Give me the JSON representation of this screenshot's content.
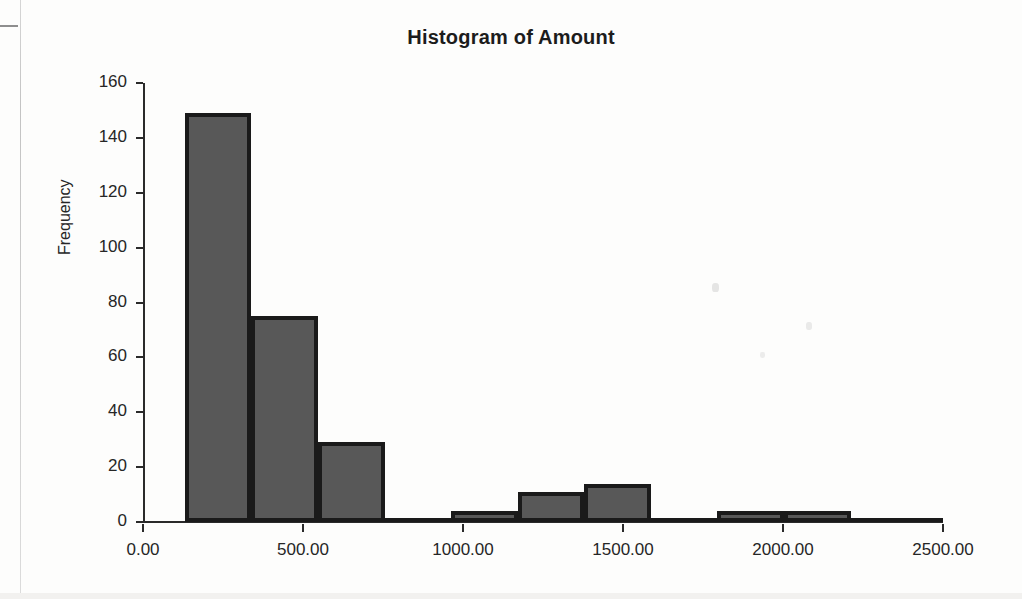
{
  "chart_data": {
    "type": "bar",
    "title": "Histogram of Amount",
    "xlabel": "",
    "ylabel": "Frequency",
    "grid": false,
    "legend": false,
    "xlim": [
      0,
      2500
    ],
    "ylim": [
      0,
      160
    ],
    "yticks": [
      0,
      20,
      40,
      60,
      80,
      100,
      120,
      140,
      160
    ],
    "ytick_labels": [
      "0",
      "20",
      "40",
      "60",
      "80",
      "100",
      "120",
      "140",
      "160"
    ],
    "xticks": [
      0,
      500,
      1000,
      1500,
      2000,
      2500
    ],
    "xtick_labels": [
      "0.00",
      "500.00",
      "1000.00",
      "1500.00",
      "2000.00",
      "2500.00"
    ],
    "bin_width": 208,
    "bars": [
      {
        "bin_start": 131,
        "bin_end": 339,
        "value": 149
      },
      {
        "bin_start": 339,
        "bin_end": 547,
        "value": 75
      },
      {
        "bin_start": 547,
        "bin_end": 755,
        "value": 29
      },
      {
        "bin_start": 755,
        "bin_end": 963,
        "value": 0
      },
      {
        "bin_start": 963,
        "bin_end": 1171,
        "value": 4
      },
      {
        "bin_start": 1171,
        "bin_end": 1379,
        "value": 11
      },
      {
        "bin_start": 1379,
        "bin_end": 1587,
        "value": 14
      },
      {
        "bin_start": 1587,
        "bin_end": 1795,
        "value": 0
      },
      {
        "bin_start": 1795,
        "bin_end": 2003,
        "value": 4
      },
      {
        "bin_start": 2003,
        "bin_end": 2211,
        "value": 4
      },
      {
        "bin_start": 2211,
        "bin_end": 2500,
        "value": 0
      }
    ],
    "categories": [
      "131-339",
      "339-547",
      "547-755",
      "755-963",
      "963-1171",
      "1171-1379",
      "1379-1587",
      "1587-1795",
      "1795-2003",
      "2003-2211",
      "2211-2500"
    ],
    "values": [
      149,
      75,
      29,
      0,
      4,
      11,
      14,
      0,
      4,
      4,
      0
    ],
    "colors": {
      "bar_fill": "#585858",
      "bar_edge": "#1a1a1a",
      "axis": "#2a2a2a",
      "text": "#262626",
      "background": "#fdfdfc"
    }
  }
}
